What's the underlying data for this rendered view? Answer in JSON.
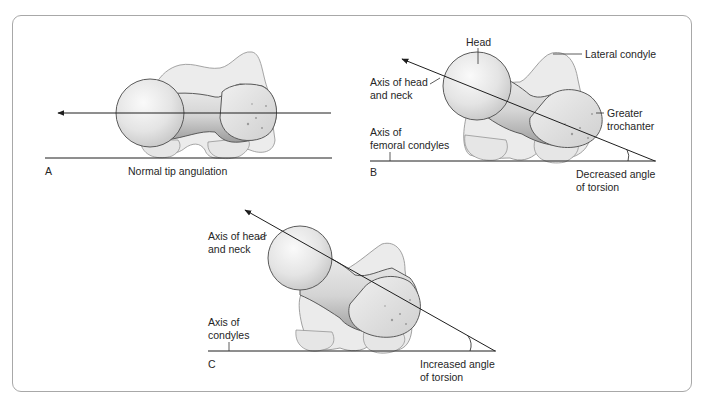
{
  "figure": {
    "panels": [
      {
        "id": "A",
        "letter": "A",
        "caption": "Normal tip angulation",
        "labels": []
      },
      {
        "id": "B",
        "letter": "B",
        "caption_line1": "Decreased angle",
        "caption_line2": "of torsion",
        "labels": {
          "head": "Head",
          "lateral_condyle": "Lateral condyle",
          "axis_head_neck_line1": "Axis of head",
          "axis_head_neck_line2": "and neck",
          "greater_trochanter_line1": "Greater",
          "greater_trochanter_line2": "trochanter",
          "axis_condyles_line1": "Axis of",
          "axis_condyles_line2": "femoral condyles"
        }
      },
      {
        "id": "C",
        "letter": "C",
        "caption_line1": "Increased angle",
        "caption_line2": "of torsion",
        "labels": {
          "axis_head_neck_line1": "Axis of head",
          "axis_head_neck_line2": "and neck",
          "axis_condyles_line1": "Axis of",
          "axis_condyles_line2": "condyles"
        }
      }
    ],
    "colors": {
      "frame_border": "#a8a8a8",
      "line": "#1e1e1e",
      "bone_fill": "#e9e9e9",
      "bone_shadow": "#c9c9c9",
      "condyle_fill": "#eeeeee",
      "bone_outline": "#6a6a6a"
    }
  }
}
